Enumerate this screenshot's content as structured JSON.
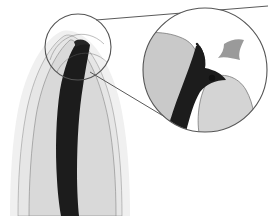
{
  "figure": {
    "width": 275,
    "height": 216,
    "background_color": "#ffffff"
  },
  "colors": {
    "background": "#ffffff",
    "periodontal_halo": "#f0f0f0",
    "dentin_outer": "#e6e6e6",
    "dentin_inner": "#d9d9d9",
    "root_canal_dark": "#1c1c1c",
    "outline_stroke": "#555555",
    "inset_tissue_gray": "#c9c9c9",
    "inset_tissue_light": "#d4d4d4",
    "arrow_gray": "#9a9a9a",
    "connector_line": "#5a5a5a",
    "dot_marker": "#111111"
  },
  "main_view": {
    "name": "tooth-root-overview",
    "description": "Longitudinal section of a tooth root tapering to the apex at upper area, with a dark root canal running down the center.",
    "parts": [
      {
        "name": "periodontal-halo",
        "label": "Periodontal halo",
        "fill": "#f0f0f0"
      },
      {
        "name": "dentin-outer-layer",
        "label": "Outer dentin layer",
        "fill": "#e6e6e6"
      },
      {
        "name": "dentin-inner-layer",
        "label": "Inner dentin layer",
        "fill": "#d9d9d9"
      },
      {
        "name": "root-canal",
        "label": "Root canal",
        "fill": "#1c1c1c"
      }
    ]
  },
  "source_circle": {
    "name": "source-region-circle",
    "label": "Region of interest",
    "cx": 78,
    "cy": 47,
    "r": 33,
    "stroke": "#555555"
  },
  "magnifier": {
    "name": "magnified-inset-circle",
    "label": "Magnified apex view",
    "cx": 205,
    "cy": 70,
    "r": 62,
    "stroke": "#555555",
    "fill": "#ffffff",
    "zoom_factor": "2x",
    "contents": [
      {
        "name": "inset-dentin-left",
        "label": "Left dentin wall",
        "fill": "#c9c9c9"
      },
      {
        "name": "inset-dentin-right",
        "label": "Right dentin wall",
        "fill": "#d0d0d0"
      },
      {
        "name": "inset-root-canal",
        "label": "Apical canal",
        "fill": "#1c1c1c"
      },
      {
        "name": "apex-dot-marker",
        "label": "Apical foramen marker",
        "fill": "#111111"
      },
      {
        "name": "pointer-arrowhead",
        "label": "Pointer arrowhead",
        "fill": "#9a9a9a"
      }
    ]
  },
  "connectors": [
    {
      "name": "connector-line-top",
      "label": "Upper leader line",
      "stroke": "#5a5a5a"
    },
    {
      "name": "connector-line-bottom",
      "label": "Lower leader line",
      "stroke": "#5a5a5a"
    }
  ],
  "annotations": {
    "arrow_direction": "right",
    "has_text_labels": false,
    "caption": ""
  }
}
